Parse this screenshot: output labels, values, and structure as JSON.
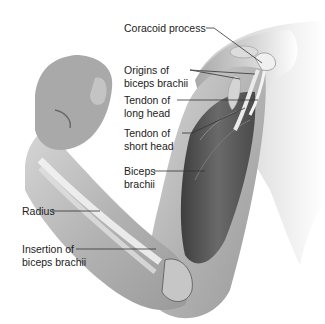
{
  "figure": {
    "labels": [
      {
        "id": "coracoid",
        "lines": [
          "Coracoid process"
        ]
      },
      {
        "id": "origins",
        "lines": [
          "Origins of",
          "biceps brachii"
        ]
      },
      {
        "id": "tendon_long",
        "lines": [
          "Tendon of",
          "long head"
        ]
      },
      {
        "id": "tendon_short",
        "lines": [
          "Tendon of",
          "short head"
        ]
      },
      {
        "id": "biceps",
        "lines": [
          "Biceps",
          "brachii"
        ]
      },
      {
        "id": "radius",
        "lines": [
          "Radius"
        ]
      },
      {
        "id": "insertion",
        "lines": [
          "Insertion of",
          "biceps brachii"
        ]
      }
    ]
  },
  "colors": {
    "background": "#ffffff",
    "skin_light": "#e4e4e4",
    "skin_mid": "#b8b8b8",
    "skin_dark": "#8a8a8a",
    "muscle": "#5a5a5a",
    "bone": "#f2f2f2",
    "leader_line": "#333333",
    "text": "#222222"
  }
}
